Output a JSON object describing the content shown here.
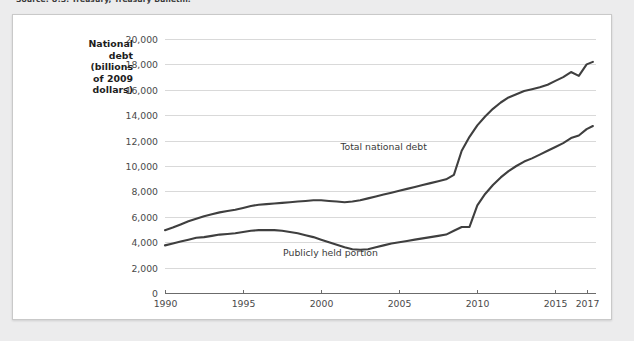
{
  "source_note": "Source: U.S. Treasury, Treasury Bulletin.",
  "chart_data": {
    "type": "line",
    "title": "",
    "xlabel": "",
    "ylabel": "National debt (billions of 2009 dollars)",
    "ylabel_lines": [
      "National",
      "debt",
      "(billions",
      "of 2009",
      "dollars)"
    ],
    "xlim": [
      1990,
      2017.6
    ],
    "ylim": [
      0,
      20000
    ],
    "grid": true,
    "legend_position": "inline-annotations",
    "ytick_labels": [
      "0",
      "2,000",
      "4,000",
      "6,000",
      "8,000",
      "10,000",
      "12,000",
      "14,000",
      "16,000",
      "18,000",
      "20,000"
    ],
    "ytick_values": [
      0,
      2000,
      4000,
      6000,
      8000,
      10000,
      12000,
      14000,
      16000,
      18000,
      20000
    ],
    "xtick_labels": [
      "1990",
      "1995",
      "2000",
      "2005",
      "2010",
      "2015",
      "2017"
    ],
    "xtick_values": [
      1990,
      1995,
      2000,
      2005,
      2010,
      2015,
      2017
    ],
    "annotations": [
      {
        "text": "Total national debt",
        "x": 2004.0,
        "y": 11250
      },
      {
        "text": "Publicly held portion",
        "x": 2000.6,
        "y": 2950
      }
    ],
    "x": [
      1990,
      1990.5,
      1991,
      1991.5,
      1992,
      1992.5,
      1993,
      1993.5,
      1994,
      1994.5,
      1995,
      1995.5,
      1996,
      1996.5,
      1997,
      1997.5,
      1998,
      1998.5,
      1999,
      1999.5,
      2000,
      2000.5,
      2001,
      2001.5,
      2002,
      2002.5,
      2003,
      2003.5,
      2004,
      2004.5,
      2005,
      2005.5,
      2006,
      2006.5,
      2007,
      2007.5,
      2008,
      2008.5,
      2009,
      2009.5,
      2010,
      2010.5,
      2011,
      2011.5,
      2012,
      2012.5,
      2013,
      2013.5,
      2014,
      2014.5,
      2015,
      2015.5,
      2016,
      2016.5,
      2017,
      2017.4
    ],
    "series": [
      {
        "name": "Total national debt",
        "values": [
          4950,
          5150,
          5400,
          5650,
          5850,
          6050,
          6200,
          6350,
          6450,
          6550,
          6700,
          6850,
          6950,
          7000,
          7050,
          7100,
          7150,
          7200,
          7250,
          7300,
          7300,
          7250,
          7200,
          7150,
          7200,
          7300,
          7450,
          7600,
          7750,
          7900,
          8050,
          8200,
          8350,
          8500,
          8650,
          8800,
          8950,
          9300,
          11200,
          12300,
          13200,
          13900,
          14500,
          15000,
          15400,
          15650,
          15900,
          16050,
          16200,
          16400,
          16700,
          17000,
          17400,
          17100,
          18000,
          18200
        ]
      },
      {
        "name": "Publicly held portion",
        "values": [
          3750,
          3900,
          4050,
          4200,
          4350,
          4400,
          4500,
          4600,
          4650,
          4700,
          4800,
          4900,
          4950,
          4950,
          4950,
          4900,
          4800,
          4700,
          4550,
          4400,
          4200,
          4000,
          3800,
          3600,
          3450,
          3400,
          3450,
          3600,
          3750,
          3900,
          4000,
          4100,
          4200,
          4300,
          4400,
          4500,
          4600,
          4900,
          5200,
          5200,
          6900,
          7800,
          8500,
          9100,
          9600,
          10000,
          10350,
          10600,
          10900,
          11200,
          11500,
          11800,
          12200,
          12400,
          12900,
          13150
        ]
      }
    ]
  }
}
